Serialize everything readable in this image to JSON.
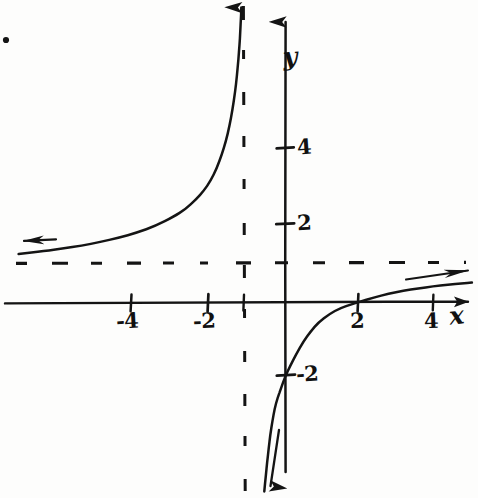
{
  "image": {
    "kind": "hand-drawn-graph-photo",
    "background_color": "#fdfdfc",
    "ink_color": "#141414",
    "width": 478,
    "height": 498
  },
  "axes": {
    "x_label": "x",
    "y_label": "y",
    "origin_px": {
      "x": 285,
      "y": 302
    },
    "px_per_unit_x": 37,
    "px_per_unit_y": 37.5,
    "x_tick_labels": [
      "-4",
      "-2",
      "2",
      "4"
    ],
    "y_tick_labels": [
      "4",
      "2",
      "-2"
    ],
    "x_ticks": [
      {
        "label": "-4",
        "value": -4,
        "px": 131
      },
      {
        "label": "-2",
        "value": -2,
        "px": 208
      },
      {
        "label": "",
        "value": -1,
        "px": 244
      },
      {
        "label": "2",
        "value": 2,
        "px": 358
      },
      {
        "label": "4",
        "value": 4,
        "px": 433
      }
    ],
    "y_ticks": [
      {
        "label": "4",
        "value": 4,
        "px": 148
      },
      {
        "label": "2",
        "value": 2,
        "px": 224
      },
      {
        "label": "-2",
        "value": -2,
        "px": 375
      }
    ]
  },
  "chart_data": {
    "type": "line",
    "title": "",
    "xlabel": "x",
    "ylabel": "y",
    "xlim": [
      -7.2,
      5.0
    ],
    "ylim": [
      -5.0,
      7.8
    ],
    "grid": false,
    "legend": "none",
    "function": "f(x) = (x - 2) / (x + 1)",
    "asymptotes": [
      {
        "kind": "vertical",
        "equation": "x = -1",
        "value": -1,
        "style": "dashed"
      },
      {
        "kind": "horizontal",
        "equation": "y = 1",
        "value": 1,
        "style": "dashed"
      }
    ],
    "intercepts": [
      {
        "kind": "x-intercept",
        "x": 2,
        "y": 0
      },
      {
        "kind": "y-intercept",
        "x": 0,
        "y": -2
      }
    ],
    "series": [
      {
        "name": "left branch (x < -1)",
        "arrow_start": true,
        "arrow_end": true,
        "points": [
          [
            -7.2,
            1.28
          ],
          [
            -6.5,
            1.36
          ],
          [
            -6.0,
            1.43
          ],
          [
            -5.5,
            1.5
          ],
          [
            -5.0,
            1.6
          ],
          [
            -4.5,
            1.71
          ],
          [
            -4.0,
            1.85
          ],
          [
            -3.5,
            2.03
          ],
          [
            -3.0,
            2.28
          ],
          [
            -2.7,
            2.47
          ],
          [
            -2.4,
            2.74
          ],
          [
            -2.2,
            2.96
          ],
          [
            -2.0,
            3.25
          ],
          [
            -1.85,
            3.56
          ],
          [
            -1.7,
            3.95
          ],
          [
            -1.6,
            4.28
          ],
          [
            -1.5,
            4.7
          ],
          [
            -1.42,
            5.13
          ],
          [
            -1.35,
            5.6
          ],
          [
            -1.3,
            6.02
          ],
          [
            -1.26,
            6.45
          ],
          [
            -1.23,
            6.85
          ],
          [
            -1.21,
            7.2
          ],
          [
            -1.19,
            7.6
          ],
          [
            -1.18,
            7.85
          ]
        ]
      },
      {
        "name": "right branch (x > -1)",
        "arrow_start": true,
        "arrow_end": true,
        "points": [
          [
            -0.56,
            -5.05
          ],
          [
            -0.52,
            -4.65
          ],
          [
            -0.48,
            -4.25
          ],
          [
            -0.44,
            -3.9
          ],
          [
            -0.4,
            -3.55
          ],
          [
            -0.34,
            -3.18
          ],
          [
            -0.28,
            -2.85
          ],
          [
            -0.2,
            -2.55
          ],
          [
            -0.1,
            -2.28
          ],
          [
            0.0,
            -2.0
          ],
          [
            0.15,
            -1.68
          ],
          [
            0.3,
            -1.4
          ],
          [
            0.5,
            -1.05
          ],
          [
            0.7,
            -0.78
          ],
          [
            0.9,
            -0.55
          ],
          [
            1.2,
            -0.32
          ],
          [
            1.5,
            -0.16
          ],
          [
            1.8,
            -0.06
          ],
          [
            2.0,
            0.0
          ],
          [
            2.4,
            0.12
          ],
          [
            2.8,
            0.22
          ],
          [
            3.2,
            0.3
          ],
          [
            3.6,
            0.36
          ],
          [
            4.0,
            0.42
          ],
          [
            4.4,
            0.46
          ],
          [
            4.8,
            0.5
          ],
          [
            5.05,
            0.52
          ]
        ]
      }
    ],
    "annotations": [
      {
        "text": "y",
        "role": "y-axis-label",
        "x_px": 286,
        "y_px": 55
      },
      {
        "text": "x",
        "role": "x-axis-label",
        "x_px": 452,
        "y_px": 307
      }
    ]
  },
  "marks": {
    "stray_dot": {
      "x_px": 6,
      "y_px": 40,
      "radius_px": 3
    }
  }
}
